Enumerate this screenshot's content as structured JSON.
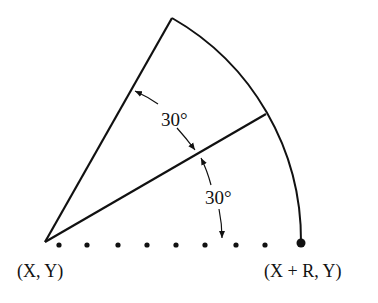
{
  "diagram": {
    "center_label": "(X, Y)",
    "end_label": "(X + R, Y)",
    "angle_upper_label": "30°",
    "angle_lower_label": "30°",
    "colors": {
      "stroke": "#111111",
      "background": "#ffffff"
    }
  }
}
